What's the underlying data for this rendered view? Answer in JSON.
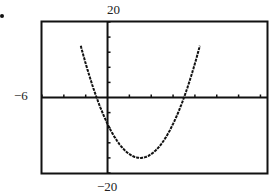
{
  "labels": {
    "ymax": "20",
    "ymin": "−20",
    "xmin": "−6"
  },
  "colors": {
    "frame": "#111111",
    "curve": "#111111",
    "background": "#ffffff"
  },
  "chart_data": {
    "type": "line",
    "title": "",
    "xlabel": "",
    "ylabel": "",
    "xlim": [
      -6,
      14.6
    ],
    "ylim": [
      -20,
      20
    ],
    "x_tick_step": 2,
    "y_tick_step": 4,
    "grid": false,
    "series": [
      {
        "name": "y = x^2 - 6x - 7",
        "x": [
          -2.4,
          -2,
          -1,
          0,
          1,
          2,
          3,
          4,
          5,
          6,
          7,
          8,
          8.4
        ],
        "values": [
          14.2,
          9,
          0,
          -7,
          -12,
          -15,
          -16,
          -15,
          -12,
          -7,
          0,
          9,
          14.2
        ]
      }
    ],
    "annotations": [
      "20",
      "−20",
      "−6"
    ]
  }
}
